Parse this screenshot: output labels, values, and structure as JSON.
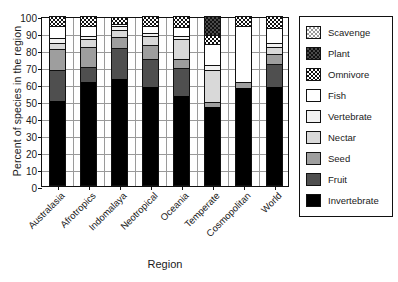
{
  "chart_data": {
    "type": "bar",
    "subtype": "stacked-bar-100",
    "title": "",
    "xlabel": "Region",
    "ylabel": "Percent of species in the region",
    "ylim": [
      0,
      100
    ],
    "ytick_step": 10,
    "yticks": [
      "100",
      "90",
      "80",
      "70",
      "60",
      "50",
      "40",
      "30",
      "20",
      "10",
      "0"
    ],
    "grid": "both",
    "legend_position": "right-outside",
    "categories": [
      "Australasia",
      "Afrotropics",
      "Indomalaya",
      "Neotropical",
      "Oceania",
      "Temperate",
      "Cosmopolitan",
      "World"
    ],
    "series": [
      {
        "name": "Invertebrate",
        "color": "#000000",
        "pattern": "solid",
        "values": [
          50,
          61,
          63,
          58.5,
          53,
          46.5,
          57.5,
          58
        ]
      },
      {
        "name": "Fruit",
        "color": "#4f4f4f",
        "pattern": "solid",
        "values": [
          18,
          9,
          18,
          16,
          16.5,
          0,
          0,
          13.5
        ]
      },
      {
        "name": "Seed",
        "color": "#9e9e9e",
        "pattern": "solid",
        "values": [
          12.5,
          11.5,
          6.5,
          8.5,
          5.5,
          3,
          3.5,
          6
        ]
      },
      {
        "name": "Nectar",
        "color": "#d9d9d9",
        "pattern": "solid",
        "values": [
          3.5,
          5,
          4.5,
          5,
          11.5,
          18.5,
          0,
          4
        ]
      },
      {
        "name": "Vertebrate",
        "color": "#f2f2f2",
        "pattern": "solid",
        "values": [
          3,
          2,
          2,
          2,
          2,
          3,
          0,
          2.5
        ]
      },
      {
        "name": "Fish",
        "color": "#ffffff",
        "pattern": "solid",
        "values": [
          7,
          5.5,
          1.5,
          4,
          5,
          12.5,
          33,
          9
        ]
      },
      {
        "name": "Omnivore",
        "color": "#ffffff",
        "pattern": "checker-dark",
        "values": [
          6,
          6,
          4,
          6,
          6.5,
          5.5,
          6,
          7
        ]
      },
      {
        "name": "Plant",
        "color": "#4a4a4a",
        "pattern": "checker-dark-fill",
        "values": [
          0,
          0,
          0,
          0,
          0,
          11,
          0,
          0
        ]
      },
      {
        "name": "Scavenge",
        "color": "#ffffff",
        "pattern": "checker-light",
        "values": [
          0,
          0,
          0,
          0,
          0,
          0,
          0,
          0
        ]
      }
    ],
    "legend_order": [
      "Scavenge",
      "Plant",
      "Omnivore",
      "Fish",
      "Vertebrate",
      "Nectar",
      "Seed",
      "Fruit",
      "Invertebrate"
    ]
  }
}
